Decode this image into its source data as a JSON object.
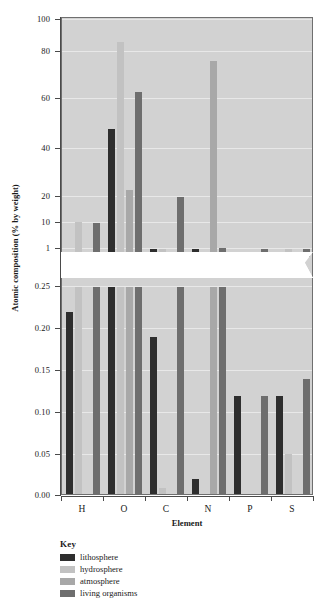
{
  "chart_data": {
    "type": "bar",
    "title": "",
    "xlabel": "Element",
    "ylabel": "Atomic composition (% by weight)",
    "categories": [
      "H",
      "O",
      "C",
      "N",
      "P",
      "S"
    ],
    "grid": true,
    "legend_position": "below-plot-left",
    "broken_axis": true,
    "axis_note": "Y axis is broken between 1 and 0.25; upper segment is non-linear (0.25,1,10,20,40,60,80,100), lower segment is linear (0.00-0.25).",
    "upper_ticks": [
      "1",
      "10",
      "20",
      "40",
      "60",
      "80",
      "100"
    ],
    "lower_ticks": [
      "0.00",
      "0.05",
      "0.10",
      "0.15",
      "0.20",
      "0.25"
    ],
    "series": [
      {
        "name": "lithosphere",
        "color": "#2e2e2e",
        "values": [
          null,
          48,
          0.19,
          0.02,
          null,
          null
        ]
      },
      {
        "name": "hydrosphere",
        "color": "#c2c2c2",
        "values": [
          10.5,
          86,
          0.01,
          null,
          null,
          0.05
        ]
      },
      {
        "name": "atmosphere",
        "color": "#a8a8a8",
        "values": [
          null,
          23,
          null,
          76,
          null,
          null
        ]
      },
      {
        "name": "living organisms",
        "color": "#6e6e6e",
        "values": [
          10,
          63,
          20,
          1.5,
          1.0,
          0.14
        ]
      }
    ],
    "lower_segment_values": {
      "note": "bars extending below the break, read on the 0.00-0.25 linear scale",
      "lithosphere": [
        0.22,
        0.25,
        0.19,
        0.02,
        0.12,
        0.12
      ],
      "hydrosphere": [
        0.25,
        0.25,
        0.01,
        0.0,
        0.0,
        0.05
      ],
      "atmosphere": [
        0.0,
        0.25,
        0.0,
        0.25,
        0.0,
        0.0
      ],
      "living organisms": [
        0.25,
        0.25,
        0.25,
        0.25,
        0.12,
        0.14
      ]
    }
  },
  "legend": {
    "title": "Key",
    "items": [
      {
        "label": "lithosphere",
        "color": "#2e2e2e"
      },
      {
        "label": "hydrosphere",
        "color": "#c2c2c2"
      },
      {
        "label": "atmosphere",
        "color": "#a8a8a8"
      },
      {
        "label": "living organisms",
        "color": "#6e6e6e"
      }
    ]
  },
  "axes": {
    "y_label": "Atomic composition (% by weight)",
    "x_label": "Element",
    "y_ticks": [
      "100",
      "80",
      "60",
      "40",
      "20",
      "10",
      "1",
      "0.25",
      "0.20",
      "0.15",
      "0.10",
      "0.05",
      "0.00"
    ],
    "x_ticks": [
      "H",
      "O",
      "C",
      "N",
      "P",
      "S"
    ]
  },
  "colors": {
    "plot_background": "#d2d2d2",
    "gridline": "#e8e8e8",
    "axis": "#4a4a4a",
    "page_background": "#ffffff"
  }
}
